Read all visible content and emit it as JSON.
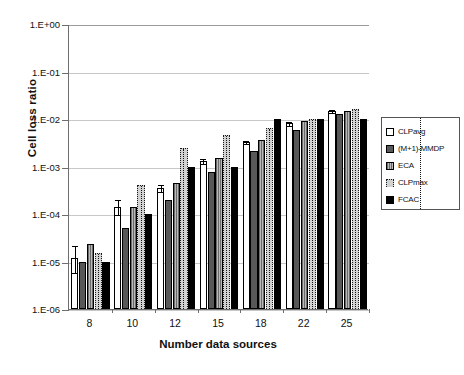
{
  "chart_data": {
    "type": "bar",
    "title": "",
    "xlabel": "Number data sources",
    "ylabel": "Cell loss ratio",
    "yscale": "log",
    "ylim": [
      1e-06,
      1.0
    ],
    "grid": true,
    "legend_position": "right",
    "categories": [
      "8",
      "10",
      "12",
      "15",
      "18",
      "22",
      "25"
    ],
    "ytick_labels": [
      "1.E+00",
      "1.E-01",
      "1.E-02",
      "1.E-03",
      "1.E-04",
      "1.E-05",
      "1.E-06"
    ],
    "ytick_values": [
      1.0,
      0.1,
      0.01,
      0.001,
      0.0001,
      1e-05,
      1e-06
    ],
    "series": [
      {
        "name": "CLPavg",
        "style": "white-open",
        "color": "#ffffff",
        "values": [
          1.2e-05,
          0.00014,
          0.00036,
          0.0013,
          0.0033,
          0.0082,
          0.015
        ],
        "error_high": [
          2.2e-05,
          0.00021,
          0.00042,
          0.0015,
          0.0036,
          0.009,
          0.016
        ],
        "error_low": [
          6e-06,
          0.0001,
          0.00031,
          0.0012,
          0.0031,
          0.0076,
          0.014
        ]
      },
      {
        "name": "(M+1)-MMDP",
        "style": "dark-gray",
        "color": "#585858",
        "values": [
          1e-05,
          5e-05,
          0.0002,
          0.00075,
          0.0021,
          0.006,
          0.013
        ]
      },
      {
        "name": "ECA",
        "style": "vertical-hatch",
        "color": "#8a8a8a",
        "values": [
          2.3e-05,
          0.00014,
          0.00044,
          0.0015,
          0.0037,
          0.0093,
          0.015
        ]
      },
      {
        "name": "CLPmax",
        "style": "light-gray-dotted",
        "color": "#d2d2d2",
        "values": [
          1.5e-05,
          0.0004,
          0.0025,
          0.0045,
          0.0065,
          0.01,
          0.016
        ]
      },
      {
        "name": "FCAC",
        "style": "solid-black",
        "color": "#000000",
        "values": [
          1e-05,
          0.0001,
          0.001,
          0.001,
          0.01,
          0.01,
          0.01
        ]
      }
    ]
  }
}
